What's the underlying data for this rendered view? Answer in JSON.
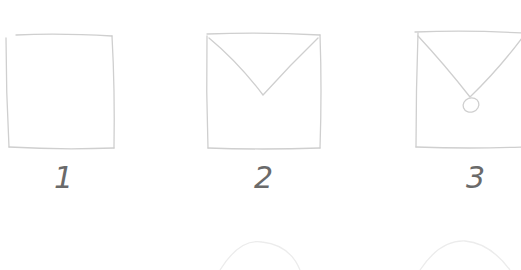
{
  "steps": [
    {
      "number": "1",
      "description": "blank square envelope"
    },
    {
      "number": "2",
      "description": "envelope with V-shaped flap"
    },
    {
      "number": "3",
      "description": "envelope with flap and seal"
    }
  ],
  "colors": {
    "stroke": "#c8c8c8",
    "number": "#6a6a6a",
    "faint": "#e6e6e6"
  }
}
